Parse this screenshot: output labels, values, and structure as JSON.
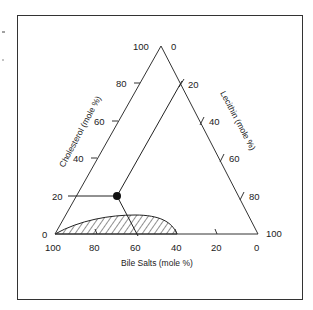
{
  "diagram": {
    "type": "ternary-phase-diagram",
    "axes": {
      "left": {
        "title": "Cholesterol (mole %)",
        "ticks": [
          "0",
          "20",
          "40",
          "60",
          "80",
          "100"
        ]
      },
      "right": {
        "title": "Lecithin (mole %)",
        "ticks": [
          "0",
          "20",
          "40",
          "60",
          "80",
          "100"
        ]
      },
      "bottom": {
        "title": "Bile Salts (mole %)",
        "ticks": [
          "100",
          "80",
          "60",
          "40",
          "20",
          "0"
        ]
      }
    },
    "point": {
      "cholesterol": 20,
      "lecithin": 20,
      "bile_salts": 60
    },
    "region": {
      "description": "hatched micellar zone along bile salts axis from 100% to ~40% bile salts, max ~10% cholesterol"
    },
    "colors": {
      "line": "#333333",
      "point": "#111111",
      "background": "#ffffff"
    }
  },
  "labels": {
    "apex_left": "100",
    "apex_right": "0",
    "left_80": "80",
    "left_60": "60",
    "left_40": "40",
    "left_20": "20",
    "left_0": "0",
    "right_20": "20",
    "right_40": "40",
    "right_60": "60",
    "right_80": "80",
    "right_100": "100",
    "bottom_100": "100",
    "bottom_80": "80",
    "bottom_60": "60",
    "bottom_40": "40",
    "bottom_20": "20",
    "bottom_0": "0",
    "cholesterol_title": "Cholesterol (mole %)",
    "lecithin_title": "Lecithin (mole %)",
    "bile_salts_title": "Bile Salts (mole %)"
  }
}
